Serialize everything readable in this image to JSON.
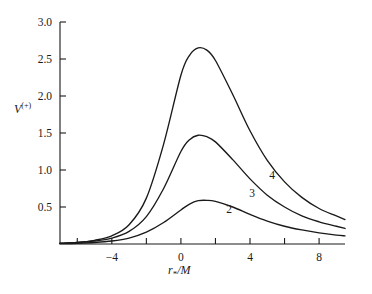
{
  "figure": {
    "background": "#ffffff",
    "line_color": "#1a1a1a"
  },
  "axes": {
    "y_label_base": "V",
    "y_label_sup": "(+)",
    "x_label_base": "r",
    "x_label_sub": "*",
    "x_label_tail": "/M",
    "y_ticks": [
      "3.0",
      "2.5",
      "2.0",
      "1.5",
      "1.0",
      "0.5"
    ],
    "x_ticks": [
      "−4",
      "0",
      "4",
      "8"
    ]
  },
  "curve_labels": [
    {
      "text": "4",
      "x": 272,
      "y": 179
    },
    {
      "text": "3",
      "x": 252,
      "y": 197
    },
    {
      "text": "2",
      "x": 229,
      "y": 213
    }
  ],
  "chart_data": {
    "type": "line",
    "title": "",
    "xlabel": "r_*/M",
    "ylabel": "V^(+)",
    "xlim": [
      -7.0,
      9.5
    ],
    "ylim": [
      0.0,
      3.0
    ],
    "xticks": [
      -4,
      0,
      4,
      8
    ],
    "yticks": [
      0.5,
      1.0,
      1.5,
      2.0,
      2.5,
      3.0
    ],
    "grid": false,
    "legend": "inline-curve-labels",
    "series": [
      {
        "name": "4",
        "label": "4",
        "peak_x": 1.0,
        "peak_y": 2.65,
        "x": [
          -7.0,
          -6.0,
          -5.0,
          -4.0,
          -3.0,
          -2.0,
          -1.0,
          0.0,
          0.5,
          1.0,
          1.5,
          2.0,
          3.0,
          4.0,
          5.0,
          6.0,
          7.0,
          8.0,
          9.0,
          9.5
        ],
        "y": [
          0.01,
          0.02,
          0.05,
          0.11,
          0.26,
          0.62,
          1.35,
          2.28,
          2.55,
          2.65,
          2.62,
          2.48,
          2.02,
          1.53,
          1.13,
          0.84,
          0.63,
          0.48,
          0.38,
          0.33
        ]
      },
      {
        "name": "3",
        "label": "3",
        "peak_x": 1.0,
        "peak_y": 1.47,
        "x": [
          -7.0,
          -6.0,
          -5.0,
          -4.0,
          -3.0,
          -2.0,
          -1.0,
          0.0,
          0.5,
          1.0,
          1.5,
          2.0,
          3.0,
          4.0,
          5.0,
          6.0,
          7.0,
          8.0,
          9.0,
          9.5
        ],
        "y": [
          0.01,
          0.02,
          0.04,
          0.08,
          0.17,
          0.37,
          0.75,
          1.25,
          1.41,
          1.47,
          1.45,
          1.38,
          1.14,
          0.88,
          0.66,
          0.5,
          0.38,
          0.3,
          0.24,
          0.21
        ]
      },
      {
        "name": "2",
        "label": "2",
        "peak_x": 1.1,
        "peak_y": 0.59,
        "x": [
          -7.0,
          -6.0,
          -5.0,
          -4.0,
          -3.0,
          -2.0,
          -1.0,
          0.0,
          0.5,
          1.0,
          1.5,
          2.0,
          3.0,
          4.0,
          5.0,
          6.0,
          7.0,
          8.0,
          9.0,
          9.5
        ],
        "y": [
          0.005,
          0.01,
          0.02,
          0.04,
          0.08,
          0.16,
          0.29,
          0.46,
          0.54,
          0.585,
          0.59,
          0.575,
          0.5,
          0.4,
          0.31,
          0.24,
          0.19,
          0.15,
          0.12,
          0.11
        ]
      }
    ]
  }
}
